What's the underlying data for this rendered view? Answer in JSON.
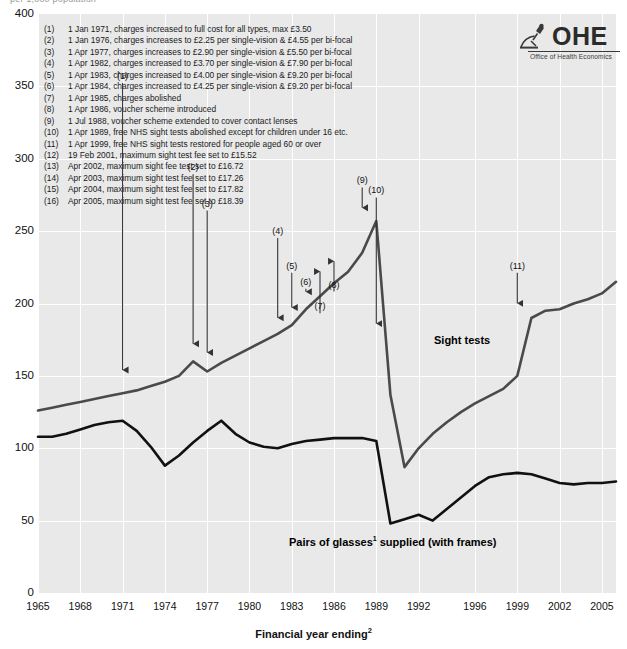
{
  "top_caption": "per 1,000 population",
  "logo": {
    "word": "OHE",
    "subtitle": "Office of Health Economics",
    "mark_name": "microscope-icon"
  },
  "axis": {
    "y_ticks": [
      "400",
      "350",
      "300",
      "250",
      "200",
      "150",
      "100",
      "50",
      "0"
    ],
    "x_ticks": [
      "1965",
      "1968",
      "1971",
      "1974",
      "1977",
      "1980",
      "1983",
      "1986",
      "1989",
      "1992",
      "1996",
      "1999",
      "2002",
      "2005"
    ],
    "x_title": "Financial year ending",
    "x_title_sup": "2"
  },
  "series_labels": {
    "sight_tests": "Sight tests",
    "glasses_main": "Pairs of glasses",
    "glasses_sup": "1",
    "glasses_tail": " supplied (with frames)"
  },
  "notes": [
    {
      "num": "(1)",
      "text": "1 Jan 1971, charges increased to full cost for all types, max £3.50"
    },
    {
      "num": "(2)",
      "text": "1 Jan 1976, charges increases to £2.25 per single-vision & £4.55 per bi-focal"
    },
    {
      "num": "(3)",
      "text": "1 Apr 1977, charges increases to £2.90 per single-vision & £5.50 per bi-focal"
    },
    {
      "num": "(4)",
      "text": "1 Apr 1982, charges increased to £3.70 per single-vision & £7.90 per bi-focal"
    },
    {
      "num": "(5)",
      "text": "1 Apr 1983, charges increased to £4.00 per single-vision & £9.20 per bi-focal"
    },
    {
      "num": "(6)",
      "text": "1 Apr 1984, charges increased to £4.25 per single-vision & £9.20 per bi-focal"
    },
    {
      "num": "(7)",
      "text": "1 Apr 1985, charges abolished"
    },
    {
      "num": "(8)",
      "text": "1 Apr 1986, voucher scheme introduced"
    },
    {
      "num": "(9)",
      "text": "1 Jul 1988, voucher scheme extended to cover contact lenses"
    },
    {
      "num": "(10)",
      "text": "1 Apr 1989, free NHS sight tests abolished except for children under 16 etc."
    },
    {
      "num": "(11)",
      "text": "1 Apr 1999, free NHS sight tests restored for people aged 60 or over"
    },
    {
      "num": "(12)",
      "text": "19 Feb 2001, maximum sight test fee set to £15.52"
    },
    {
      "num": "(13)",
      "text": "Apr 2002, maximum sight fee test set to £16.72"
    },
    {
      "num": "(14)",
      "text": "Apr 2003, maximum sight test fee set to £17.26"
    },
    {
      "num": "(15)",
      "text": "Apr 2004, maximum sight test fee set to £17.82"
    },
    {
      "num": "(16)",
      "text": "Apr 2005, maximum sight test fee set to £18.39"
    }
  ],
  "colors": {
    "plot_background": "#e9e9e9",
    "gridline": "#ffffff",
    "sight_tests_line": "#4a4a4a",
    "glasses_line": "#111111",
    "callout_arrow": "#333333"
  },
  "chart_data": {
    "type": "line",
    "title": "",
    "subtitle": "per 1,000 population",
    "xlabel": "Financial year ending",
    "ylabel": "per 1,000 population",
    "xlim": [
      1965,
      2006
    ],
    "ylim": [
      0,
      400
    ],
    "grid": true,
    "legend": "inline-labels",
    "x": [
      1965,
      1966,
      1967,
      1968,
      1969,
      1970,
      1971,
      1972,
      1973,
      1974,
      1975,
      1976,
      1977,
      1978,
      1979,
      1980,
      1981,
      1982,
      1983,
      1984,
      1985,
      1986,
      1987,
      1988,
      1989,
      1990,
      1991,
      1992,
      1993,
      1994,
      1995,
      1996,
      1997,
      1998,
      1999,
      2000,
      2001,
      2002,
      2003,
      2004,
      2005,
      2006
    ],
    "series": [
      {
        "name": "Sight tests",
        "color": "#4a4a4a",
        "values": [
          126,
          128,
          130,
          132,
          134,
          136,
          138,
          140,
          143,
          146,
          150,
          160,
          153,
          159,
          164,
          169,
          174,
          179,
          185,
          196,
          205,
          214,
          222,
          235,
          257,
          137,
          87,
          100,
          110,
          118,
          125,
          131,
          136,
          141,
          150,
          190,
          195,
          196,
          200,
          203,
          207,
          215
        ]
      },
      {
        "name": "Pairs of glasses supplied (with frames)",
        "color": "#111111",
        "values": [
          108,
          108,
          110,
          113,
          116,
          118,
          119,
          112,
          101,
          88,
          95,
          104,
          112,
          119,
          110,
          104,
          101,
          100,
          103,
          105,
          106,
          107,
          107,
          107,
          105,
          48,
          51,
          54,
          50,
          58,
          66,
          74,
          80,
          82,
          83,
          82,
          79,
          76,
          75,
          76,
          76,
          77
        ]
      }
    ],
    "annotations": [
      {
        "id": "(1)",
        "x": 1971,
        "label_y": 355,
        "arrow_to_y": 150
      },
      {
        "id": "(2)",
        "x": 1976,
        "label_y": 292,
        "arrow_to_y": 168
      },
      {
        "id": "(3)",
        "x": 1977,
        "label_y": 267,
        "arrow_to_y": 162
      },
      {
        "id": "(4)",
        "x": 1982,
        "label_y": 248,
        "arrow_to_y": 186
      },
      {
        "id": "(5)",
        "x": 1983,
        "label_y": 224,
        "arrow_to_y": 193
      },
      {
        "id": "(6)",
        "x": 1984,
        "label_y": 213,
        "arrow_to_y": 204
      },
      {
        "id": "(7)",
        "x": 1985,
        "label_y": 196,
        "arrow_to_y": 218
      },
      {
        "id": "(8)",
        "x": 1986,
        "label_y": 211,
        "arrow_to_y": 225
      },
      {
        "id": "(9)",
        "x": 1988,
        "label_y": 283,
        "arrow_to_y": 262
      },
      {
        "id": "(10)",
        "x": 1989,
        "label_y": 276,
        "arrow_to_y": 182
      },
      {
        "id": "(11)",
        "x": 1999,
        "label_y": 224,
        "arrow_to_y": 196
      }
    ]
  }
}
